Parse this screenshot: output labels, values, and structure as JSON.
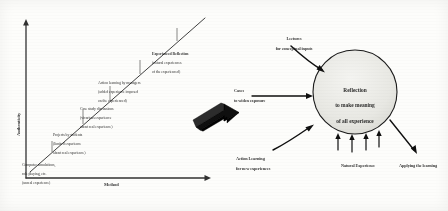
{
  "figure": {
    "left_chart": {
      "yaxis_label": "Authenticity",
      "xaxis_label": "Method",
      "trend_line": "ascending diagonal",
      "levels": [
        {
          "index": 1,
          "heading": "Computer simulations,",
          "line2": "role playing, etc.",
          "line3": "(unreal experience)"
        },
        {
          "index": 2,
          "heading": "Projects by students",
          "line2": "(limited experience",
          "line3": "about real experience)"
        },
        {
          "index": 3,
          "heading": "Case study discussions",
          "line2": "(vicarious experience",
          "line3": "about real experience)"
        },
        {
          "index": 4,
          "heading": "Action learning by managers",
          "line2": "(added experience imposed",
          "line3": "on the experienced)"
        },
        {
          "index": 5,
          "heading": "Experienced Reflection",
          "line2": "(natural experiences",
          "line3": "of the experienced)"
        }
      ]
    },
    "transition_arrow": "block-arrow-right",
    "right_model": {
      "center": {
        "line1": "Reflection",
        "line2": "to make meaning",
        "line3": "of all experience"
      },
      "inputs": [
        {
          "id": "lectures",
          "line1": "Lectures",
          "line2": "for conceptual inputs",
          "position": "top-left",
          "arrow": "curved-into-circle"
        },
        {
          "id": "cases",
          "line1": "Cases",
          "line2": "to widen exposure",
          "position": "left",
          "arrow": "straight-into-circle"
        },
        {
          "id": "action-learning",
          "line1": "Action Learning",
          "line2": "for new experiences",
          "position": "bottom-left",
          "arrow": "diagonal-into-circle"
        },
        {
          "id": "natural-experience",
          "line1": "Natural Experience",
          "line2": "",
          "position": "bottom-center",
          "arrow": "multiple-vertical-into-circle"
        },
        {
          "id": "applying-the-learning",
          "line1": "Applying the learning",
          "line2": "",
          "position": "bottom-right",
          "arrow": "diagonal-out-of-circle"
        }
      ]
    }
  },
  "colors": {
    "ink": "#1a1a1a",
    "paper": "#fdfdfb",
    "circle_fill": "#e8e8e4",
    "arrow_fill": "#111111"
  }
}
